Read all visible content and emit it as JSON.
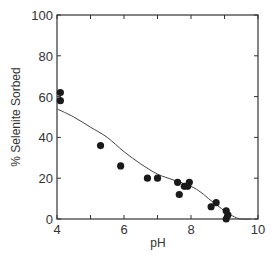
{
  "chart_data": {
    "type": "scatter",
    "title": "",
    "xlabel": "pH",
    "ylabel": "% Selenite Sorbed",
    "xlim": [
      4,
      10
    ],
    "ylim": [
      0,
      100
    ],
    "xticks": [
      "4",
      "6",
      "8",
      "10"
    ],
    "yticks": [
      "0",
      "20",
      "40",
      "60",
      "80",
      "100"
    ],
    "grid": false,
    "series": [
      {
        "name": "observed",
        "kind": "scatter",
        "points": [
          [
            4.1,
            62
          ],
          [
            4.1,
            58
          ],
          [
            5.3,
            36
          ],
          [
            5.9,
            26
          ],
          [
            6.7,
            20
          ],
          [
            7.0,
            20
          ],
          [
            7.6,
            18
          ],
          [
            7.65,
            12
          ],
          [
            7.8,
            16
          ],
          [
            7.9,
            16
          ],
          [
            7.95,
            18
          ],
          [
            8.6,
            6
          ],
          [
            8.75,
            8
          ],
          [
            9.05,
            4
          ],
          [
            9.1,
            2
          ],
          [
            9.05,
            0
          ]
        ]
      },
      {
        "name": "model fit",
        "kind": "line",
        "points": [
          [
            4.0,
            54
          ],
          [
            4.5,
            50
          ],
          [
            5.0,
            45
          ],
          [
            5.5,
            40
          ],
          [
            6.0,
            33
          ],
          [
            6.5,
            27
          ],
          [
            7.0,
            22
          ],
          [
            7.5,
            19
          ],
          [
            8.0,
            16
          ],
          [
            8.3,
            13
          ],
          [
            8.6,
            9
          ],
          [
            9.0,
            4
          ],
          [
            9.3,
            1
          ],
          [
            9.5,
            0
          ],
          [
            9.8,
            0
          ]
        ]
      }
    ]
  }
}
